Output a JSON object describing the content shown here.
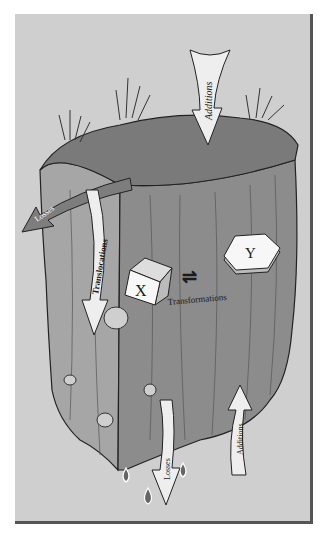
{
  "diagram": {
    "labels": {
      "additions_top": "Additions",
      "losses_left": "Losses",
      "translocations": "Translocations",
      "transformations": "Transformations",
      "block_x": "X",
      "block_y": "Y",
      "losses_bottom": "Losses",
      "additions_bottom": "Additions"
    },
    "equilibrium_symbol": "⇌",
    "colors": {
      "background": "#cfcfcf",
      "frame_shadow": "#555555",
      "soil_face_left": "#9a9a9a",
      "soil_face_front": "#8a8a8a",
      "soil_top": "#7a7a7a",
      "arrow_light": "#eeeeee",
      "arrow_losses": "#7d7d7d"
    }
  }
}
